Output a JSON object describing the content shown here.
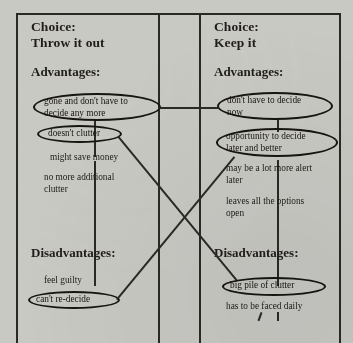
{
  "document": {
    "kind": "hand-drawn decision balance sheet",
    "background_color": "#c9c9c4",
    "ink_color": "#2b2926"
  },
  "columns": [
    {
      "id": "throw-it-out",
      "choice_label": "Choice:",
      "choice_value": "Throw it out",
      "advantages_heading": "Advantages:",
      "advantages": [
        {
          "text": "gone and don't have to\ndecide any more",
          "circled": true
        },
        {
          "text": "doesn't clutter",
          "circled": true
        },
        {
          "text": "might save money",
          "circled": false
        },
        {
          "text": "no more additional\nclutter",
          "circled": false
        }
      ],
      "disadvantages_heading": "Disadvantages:",
      "disadvantages": [
        {
          "text": "feel guilty",
          "circled": false
        },
        {
          "text": "can't re-decide",
          "circled": true
        }
      ]
    },
    {
      "id": "keep-it",
      "choice_label": "Choice:",
      "choice_value": "Keep it",
      "advantages_heading": "Advantages:",
      "advantages": [
        {
          "text": "don't have to decide\nnow",
          "circled": true
        },
        {
          "text": "opportunity to decide\nlater and better",
          "circled": true
        },
        {
          "text": "may be a lot more alert\nlater",
          "circled": false
        },
        {
          "text": "leaves all the options\nopen",
          "circled": false
        }
      ],
      "disadvantages_heading": "Disadvantages:",
      "disadvantages": [
        {
          "text": "big pile of clutter",
          "circled": true
        },
        {
          "text": "has to be faced daily",
          "circled": false
        }
      ]
    }
  ],
  "links": [
    {
      "id": "link-top-advantages",
      "from": "gone and don't have to decide any more",
      "to": "don't have to decide now",
      "style": "horizontal"
    },
    {
      "id": "link-clutter",
      "from": "doesn't clutter",
      "to": "big pile of clutter",
      "style": "diagonal"
    },
    {
      "id": "link-redecide",
      "from": "can't re-decide",
      "to": "opportunity to decide later and better",
      "style": "diagonal"
    }
  ]
}
